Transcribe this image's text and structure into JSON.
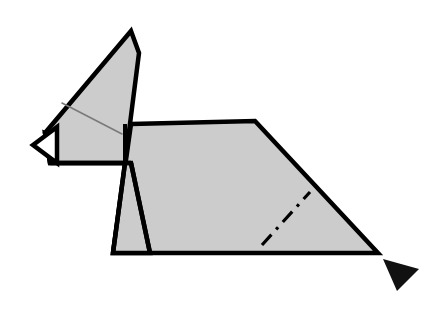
{
  "figure": {
    "width": 443,
    "height": 323,
    "background_color": "#ffffff"
  },
  "style": {
    "paper_fill": "#cccccc",
    "paper_fill_white": "#ffffff",
    "outline_color": "#000000",
    "outline_width": 4.5,
    "thin_outline_width": 3.5,
    "soft_crease_color": "#7a7a7a",
    "soft_crease_width": 1.6,
    "fold_line_color": "#000000",
    "fold_line_width": 3.2,
    "fold_line_dasharray": "14 7 3 7",
    "arrow_fill": "#111111"
  },
  "shapes": {
    "ear_panel": {
      "name": "ear-panel",
      "points": "131,31 139,53 125,163 50,163 45,133",
      "fill": "#cccccc"
    },
    "snout": {
      "name": "snout-triangle",
      "points": "33,145 57,127 57,163",
      "fill": "#ffffff"
    },
    "head_wedge": {
      "name": "head-wedge",
      "points": "45,133 125,163 50,163",
      "fill": "#cccccc"
    },
    "neck_strip": {
      "name": "neck-strip",
      "points": "125,124 131,124 125,163",
      "fill": "#cccccc"
    },
    "front_leg": {
      "name": "front-leg",
      "points": "125,163 131,163 150,253 113,253",
      "fill": "#cccccc"
    },
    "body": {
      "name": "body-panel",
      "points": "131,124 255,121 378,253 113,253",
      "fill": "#cccccc"
    },
    "tail_arrow": {
      "name": "tail-arrowhead",
      "points": "383,259 419,269 397,291",
      "fill": "#111111"
    }
  },
  "creases": {
    "ear_soft_crease": {
      "name": "ear-soft-crease",
      "x1": 62,
      "y1": 103,
      "x2": 122,
      "y2": 134,
      "kind": "soft-crease"
    },
    "body_fold_line": {
      "name": "body-fold-line",
      "x1": 262,
      "y1": 245,
      "x2": 310,
      "y2": 192,
      "kind": "dash-dot-fold"
    },
    "jaw_line": {
      "name": "jaw-line",
      "x1": 50,
      "y1": 163,
      "x2": 131,
      "y2": 163,
      "kind": "edge"
    },
    "neck_line": {
      "name": "neck-line",
      "x1": 125,
      "y1": 124,
      "x2": 125,
      "y2": 163,
      "kind": "edge"
    },
    "leg_inner_line": {
      "name": "leg-inner-edge",
      "x1": 131,
      "y1": 163,
      "x2": 150,
      "y2": 253,
      "kind": "edge"
    },
    "leg_outer_line": {
      "name": "leg-outer-edge",
      "x1": 125,
      "y1": 163,
      "x2": 113,
      "y2": 253,
      "kind": "edge"
    }
  }
}
